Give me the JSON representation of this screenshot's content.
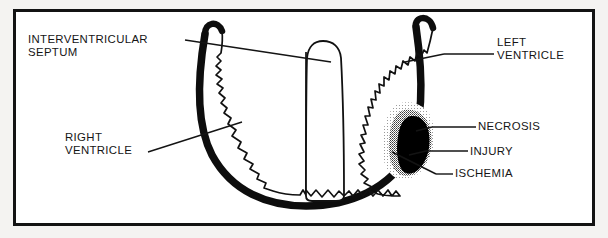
{
  "figure": {
    "kind": "anatomical-diagram",
    "frame_color": "#131313",
    "page_background": "#f4f3f1",
    "panel_background": "#ffffff"
  },
  "labels": {
    "interventricular_septum": "INTERVENTRICULAR\nSEPTUM",
    "left_ventricle": "LEFT\nVENTRICLE",
    "right_ventricle": "RIGHT\nVENTRICLE",
    "necrosis": "NECROSIS",
    "injury": "INJURY",
    "ischemia": "ISCHEMIA"
  },
  "zones": [
    {
      "name": "necrosis",
      "shading": "solid-black",
      "color": "#000000",
      "position": "innermost core of infarct"
    },
    {
      "name": "injury",
      "shading": "dense-stipple",
      "color": "#6a6a6a",
      "position": "middle band of infarct"
    },
    {
      "name": "ischemia",
      "shading": "light-stipple",
      "color": "#c2c2c2",
      "position": "outermost halo of infarct"
    }
  ],
  "structures": [
    {
      "name": "myocardial-wall",
      "style": "thick black outline"
    },
    {
      "name": "trabeculated-endocardium",
      "style": "jagged inner contour"
    },
    {
      "name": "interventricular-septum",
      "style": "central finger-shaped partition"
    }
  ]
}
